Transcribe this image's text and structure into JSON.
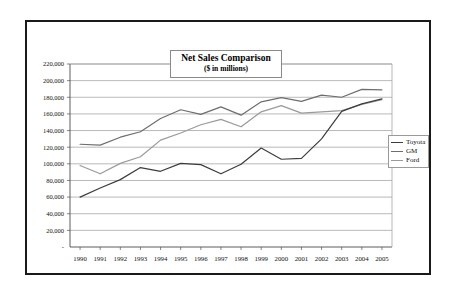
{
  "chart_data": {
    "type": "line",
    "title": "Net Sales Comparison",
    "subtitle": "($ in millions)",
    "xlabel": "",
    "ylabel": "",
    "ylim": [
      0,
      220000
    ],
    "ytick_step": 20000,
    "grid": true,
    "legend_position": "right",
    "categories": [
      "1990",
      "1991",
      "1992",
      "1993",
      "1994",
      "1995",
      "1996",
      "1997",
      "1998",
      "1999",
      "2000",
      "2001",
      "2002",
      "2003",
      "2004",
      "2005"
    ],
    "ytick_labels": [
      "220,000",
      "200,000",
      "180,000",
      "160,000",
      "140,000",
      "120,000",
      "100,000",
      "80,000",
      "60,000",
      "40,000",
      "20,000",
      "-"
    ],
    "series": [
      {
        "name": "Toyota",
        "color": "#3d3d3d",
        "values": [
          60000,
          71000,
          81000,
          95500,
          91000,
          100500,
          99000,
          88000,
          99500,
          119000,
          105500,
          106500,
          130000,
          163000,
          172000,
          178000
        ]
      },
      {
        "name": "GM",
        "color": "#6e6e6e",
        "values": [
          123500,
          122500,
          132000,
          138500,
          154500,
          165000,
          159500,
          168500,
          158500,
          174500,
          179500,
          175000,
          182500,
          180000,
          189500,
          189000
        ]
      },
      {
        "name": "Ford",
        "color": "#9a9a9a",
        "values": [
          98000,
          88000,
          100500,
          108500,
          128500,
          137000,
          147000,
          153500,
          144500,
          162500,
          170000,
          161000,
          162500,
          164000,
          171500,
          177000
        ]
      }
    ]
  },
  "legend": {
    "items": [
      {
        "label": "Toyota"
      },
      {
        "label": "GM"
      },
      {
        "label": "Ford"
      }
    ]
  }
}
